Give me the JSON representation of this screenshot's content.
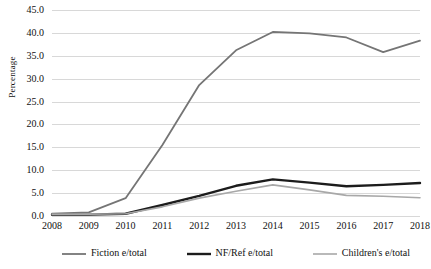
{
  "chart_data": {
    "type": "line",
    "title": "",
    "xlabel": "",
    "ylabel": "Percentage",
    "categories": [
      "2008",
      "2009",
      "2010",
      "2011",
      "2012",
      "2013",
      "2014",
      "2015",
      "2016",
      "2017",
      "2018"
    ],
    "x": [
      2008,
      2009,
      2010,
      2011,
      2012,
      2013,
      2014,
      2015,
      2016,
      2017,
      2018
    ],
    "ylim": [
      0.0,
      45.0
    ],
    "y_ticks": [
      "0.0",
      "5.0",
      "10.0",
      "15.0",
      "20.0",
      "25.0",
      "30.0",
      "35.0",
      "40.0",
      "45.0"
    ],
    "y_tick_values": [
      0.0,
      5.0,
      10.0,
      15.0,
      20.0,
      25.0,
      30.0,
      35.0,
      40.0,
      45.0
    ],
    "grid": "horizontal",
    "legend_position": "bottom",
    "series": [
      {
        "name": "Fiction e/total",
        "color": "#757575",
        "width": 1.8,
        "values": [
          0.5,
          0.8,
          3.9,
          15.5,
          28.6,
          36.2,
          40.2,
          39.9,
          39.0,
          35.8,
          38.3
        ]
      },
      {
        "name": "NF/Ref e/total",
        "color": "#1c1c1c",
        "width": 2.4,
        "values": [
          0.3,
          0.3,
          0.5,
          2.4,
          4.4,
          6.6,
          8.0,
          7.3,
          6.5,
          6.8,
          7.2
        ]
      },
      {
        "name": "Children's e/total",
        "color": "#a8a8a8",
        "width": 1.6,
        "values": [
          0.4,
          0.4,
          0.5,
          2.0,
          3.9,
          5.4,
          6.8,
          5.7,
          4.5,
          4.3,
          4.0
        ]
      }
    ]
  },
  "axis": {
    "y_title": "Percentage"
  },
  "legend": {
    "items": [
      {
        "label": "Fiction e/total"
      },
      {
        "label": "NF/Ref e/total"
      },
      {
        "label": "Children's e/total"
      }
    ]
  }
}
